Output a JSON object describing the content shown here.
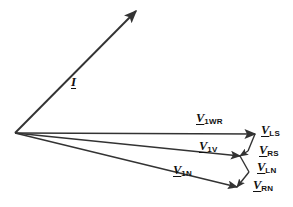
{
  "figure": {
    "type": "phasor-diagram",
    "background_color": "#ffffff",
    "line_color": "#333333",
    "text_color": "#111111",
    "width": 293,
    "height": 207,
    "origin": {
      "x": 15,
      "y": 133
    }
  },
  "labels": {
    "current": {
      "symbol": "I",
      "subscript": ""
    },
    "v1wr": {
      "symbol": "V",
      "subscript": "1WR"
    },
    "v1v": {
      "symbol": "V",
      "subscript": "1V"
    },
    "v1n": {
      "symbol": "V",
      "subscript": "1N"
    },
    "vls": {
      "symbol": "V",
      "subscript": "LS"
    },
    "vrs": {
      "symbol": "V",
      "subscript": "RS"
    },
    "vln": {
      "symbol": "V",
      "subscript": "LN"
    },
    "vrn": {
      "symbol": "V",
      "subscript": "RN"
    }
  },
  "chart_data": {
    "type": "scatter",
    "title": "",
    "xlabel": "",
    "ylabel": "",
    "grid": false,
    "legend": "none",
    "note": "Phasor (vector) diagram: current phasor I and three voltage phasors from a common origin, with small connecting phasors V_LS, V_RS, V_LN, V_RN forming a zigzag between the voltage phasor tips.",
    "origin": {
      "x": 15,
      "y": 133
    },
    "vectors": [
      {
        "name": "I",
        "from": [
          15,
          133
        ],
        "to": [
          136,
          11
        ],
        "arrow": true,
        "label": "I",
        "label_pos": [
          73,
          81
        ]
      },
      {
        "name": "V1WR",
        "from": [
          15,
          133
        ],
        "to": [
          255,
          134
        ],
        "arrow": true,
        "label": "V1WR",
        "label_pos": [
          196,
          114
        ]
      },
      {
        "name": "V1V",
        "from": [
          15,
          133
        ],
        "to": [
          240,
          156
        ],
        "arrow": true,
        "label": "V1V",
        "label_pos": [
          197,
          142
        ]
      },
      {
        "name": "V1N",
        "from": [
          15,
          133
        ],
        "to": [
          237,
          187
        ],
        "arrow": true,
        "label": "V1N",
        "label_pos": [
          172,
          166
        ]
      },
      {
        "name": "VLS",
        "from": [
          255,
          134
        ],
        "to": [
          248,
          151
        ],
        "arrow": false,
        "label": "VLS",
        "label_pos": [
          259,
          126
        ]
      },
      {
        "name": "VRS",
        "from": [
          248,
          151
        ],
        "to": [
          240,
          156
        ],
        "arrow": true,
        "label": "VRS",
        "label_pos": [
          258,
          146
        ]
      },
      {
        "name": "VLN",
        "from": [
          240,
          156
        ],
        "to": [
          249,
          172
        ],
        "arrow": false,
        "label": "VLN",
        "label_pos": [
          256,
          163
        ]
      },
      {
        "name": "VRN",
        "from": [
          249,
          172
        ],
        "to": [
          237,
          187
        ],
        "arrow": true,
        "label": "VRN",
        "label_pos": [
          252,
          180
        ]
      }
    ]
  }
}
